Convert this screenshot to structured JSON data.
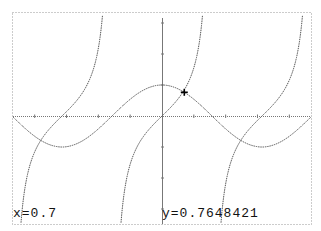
{
  "calculator": {
    "functions": [
      "cos(x)",
      "tan(x)"
    ],
    "trace": {
      "x_label": "x=0.7",
      "y_label": "y=0.7648421",
      "x": 0.7,
      "y": 0.7648421
    },
    "window": {
      "xmin": -4.7124,
      "xmax": 4.7124,
      "ymin": -3.0,
      "ymax": 3.1
    },
    "colors": {
      "background": "#ffffff",
      "curve": "#555555",
      "axis": "#777777",
      "frame": "#999999",
      "cursor": "#000000"
    }
  }
}
